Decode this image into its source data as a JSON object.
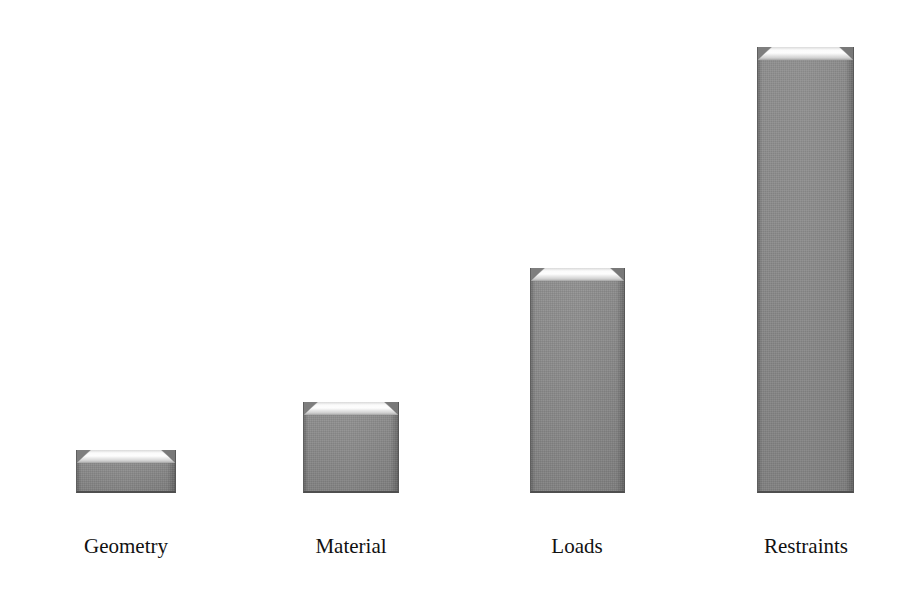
{
  "chart_data": {
    "type": "bar",
    "title": "",
    "subtitle": "",
    "xlabel": "",
    "ylabel": "",
    "categories": [
      "Geometry",
      "Material",
      "Loads",
      "Restraints"
    ],
    "values": [
      43,
      91,
      225,
      446
    ],
    "value_unit": "px",
    "ylim": [
      0,
      446
    ],
    "grid": false,
    "legend": null,
    "axes_visible": false,
    "orientation": "vertical",
    "bar_style": "beveled-3d-grey",
    "bars": [
      {
        "label": "Geometry",
        "value": 43,
        "left": 76,
        "width": 100,
        "top": 450,
        "height": 43,
        "label_left": 56,
        "label_width": 140,
        "label_top": 534
      },
      {
        "label": "Material",
        "value": 91,
        "left": 303,
        "width": 96,
        "top": 402,
        "height": 91,
        "label_left": 281,
        "label_width": 140,
        "label_top": 534
      },
      {
        "label": "Loads",
        "value": 225,
        "left": 530,
        "width": 95,
        "top": 268,
        "height": 225,
        "label_left": 507,
        "label_width": 140,
        "label_top": 534
      },
      {
        "label": "Restraints",
        "value": 446,
        "left": 757,
        "width": 97,
        "top": 47,
        "height": 446,
        "label_left": 736,
        "label_width": 140,
        "label_top": 534
      }
    ]
  },
  "colors": {
    "background": "#ffffff",
    "bar_fill": "#919191",
    "bar_highlight": "#fdfdfd",
    "bar_shadow": "#4f4f4f",
    "label_text": "#111111"
  }
}
